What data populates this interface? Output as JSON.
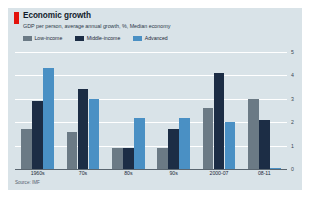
{
  "card": {
    "background_color": "#d9e3e8",
    "accent_color": "#e3120b"
  },
  "header": {
    "title": "Economic growth",
    "subtitle": "GDP per person, average annual growth, %, Median economy"
  },
  "legend": {
    "position": "top-left",
    "items": [
      {
        "label": "Low-income",
        "color": "#6b7a85"
      },
      {
        "label": "Middle-income",
        "color": "#1c2d45"
      },
      {
        "label": "Advanced",
        "color": "#4a90c4"
      }
    ]
  },
  "source": {
    "text": "Source: IMF"
  },
  "chart_data": {
    "type": "bar",
    "title": "Economic growth",
    "subtitle": "GDP per person, average annual growth, %, Median economy",
    "xlabel": "",
    "ylabel": "",
    "ylim": [
      0,
      5
    ],
    "yticks": [
      0,
      1,
      2,
      3,
      4,
      5
    ],
    "ytick_labels": [
      "0",
      "1",
      "2",
      "3",
      "4",
      "5"
    ],
    "y_axis_position": "right",
    "grid": true,
    "grid_orientation": "horizontal",
    "legend_position": "top-left",
    "categories": [
      "1960s",
      "70s",
      "80s",
      "90s",
      "2000-07",
      "08-11"
    ],
    "series": [
      {
        "name": "Low-income",
        "color": "#6b7a85",
        "values": [
          1.7,
          1.6,
          0.9,
          0.9,
          2.6,
          3.0
        ]
      },
      {
        "name": "Middle-income",
        "color": "#1c2d45",
        "values": [
          2.9,
          3.4,
          0.9,
          1.7,
          4.1,
          2.1
        ]
      },
      {
        "name": "Advanced",
        "color": "#4a90c4",
        "values": [
          4.3,
          3.0,
          2.2,
          2.2,
          2.0,
          0.05
        ]
      }
    ],
    "source": "Source: IMF"
  }
}
